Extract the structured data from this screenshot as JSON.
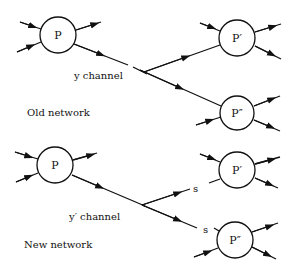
{
  "diagram": {
    "top": {
      "caption": "Old network",
      "channel_label": "y channel",
      "nodes": [
        {
          "id": "P",
          "label": "P"
        },
        {
          "id": "P1",
          "label": "P′"
        },
        {
          "id": "P2",
          "label": "P″"
        }
      ]
    },
    "bottom": {
      "caption": "New network",
      "channel_label": "y′ channel",
      "branch_labels": [
        "s",
        "s"
      ],
      "nodes": [
        {
          "id": "P",
          "label": "P"
        },
        {
          "id": "P1",
          "label": "P′"
        },
        {
          "id": "P2",
          "label": "P″"
        }
      ]
    }
  }
}
